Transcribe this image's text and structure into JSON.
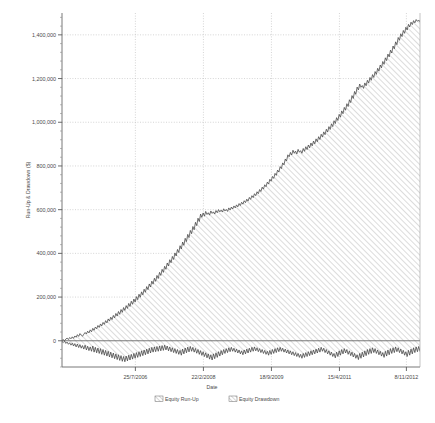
{
  "chart_data": {
    "type": "area",
    "title": "",
    "xlabel": "Date",
    "ylabel": "Run-Up & Drawdown ($)",
    "grid": true,
    "legend_position": "bottom",
    "ylim": [
      -120000,
      1500000
    ],
    "yticks": [
      0,
      200000,
      400000,
      600000,
      800000,
      1000000,
      1200000,
      1400000
    ],
    "ytick_labels": [
      "0",
      "200,000",
      "400,000",
      "600,000",
      "800,000",
      "1,000,000",
      "1,200,000",
      "1,400,000"
    ],
    "xticks": [
      "25/7/2006",
      "22/2/2008",
      "18/9/2009",
      "15/4/2011",
      "8/11/2012"
    ],
    "xtick_positions": [
      0.205,
      0.395,
      0.585,
      0.775,
      0.962
    ],
    "xlim_labels": [
      "start",
      "end"
    ],
    "series": [
      {
        "name": "Equity Run-Up",
        "fill": "hatch",
        "color": "#4d4d4d",
        "values": [
          2000,
          5000,
          1000,
          8000,
          12000,
          6000,
          15000,
          9000,
          18000,
          11000,
          22000,
          16000,
          28000,
          20000,
          33000,
          26000,
          21000,
          30000,
          38000,
          31000,
          44000,
          36000,
          50000,
          41000,
          57000,
          48000,
          63000,
          55000,
          70000,
          61000,
          77000,
          68000,
          84000,
          75000,
          92000,
          82000,
          100000,
          90000,
          108000,
          97000,
          116000,
          105000,
          125000,
          113000,
          134000,
          121000,
          143000,
          130000,
          152000,
          139000,
          161000,
          148000,
          171000,
          157000,
          181000,
          167000,
          191000,
          177000,
          202000,
          188000,
          213000,
          199000,
          224000,
          210000,
          236000,
          222000,
          248000,
          234000,
          260000,
          246000,
          273000,
          259000,
          286000,
          272000,
          299000,
          285000,
          313000,
          299000,
          327000,
          313000,
          341000,
          327000,
          356000,
          342000,
          371000,
          357000,
          386000,
          372000,
          402000,
          388000,
          418000,
          404000,
          435000,
          420000,
          452000,
          437000,
          469000,
          454000,
          487000,
          472000,
          505000,
          490000,
          523000,
          508000,
          542000,
          527000,
          561000,
          546000,
          580000,
          565000,
          585000,
          570000,
          592000,
          578000,
          586000,
          575000,
          594000,
          583000,
          590000,
          580000,
          596000,
          586000,
          600000,
          590000,
          598000,
          589000,
          604000,
          594000,
          601000,
          592000,
          608000,
          598000,
          612000,
          603000,
          617000,
          608000,
          622000,
          613000,
          628000,
          619000,
          634000,
          625000,
          641000,
          632000,
          648000,
          639000,
          656000,
          647000,
          664000,
          655000,
          673000,
          664000,
          682000,
          673000,
          692000,
          683000,
          703000,
          694000,
          714000,
          705000,
          726000,
          717000,
          739000,
          730000,
          752000,
          743000,
          766000,
          757000,
          781000,
          772000,
          797000,
          788000,
          814000,
          805000,
          832000,
          823000,
          851000,
          842000,
          862000,
          850000,
          872000,
          858000,
          868000,
          855000,
          876000,
          863000,
          870000,
          858000,
          880000,
          867000,
          888000,
          875000,
          896000,
          883000,
          905000,
          892000,
          914000,
          901000,
          924000,
          911000,
          934000,
          921000,
          945000,
          932000,
          956000,
          943000,
          968000,
          955000,
          980000,
          967000,
          993000,
          980000,
          1007000,
          994000,
          1021000,
          1008000,
          1036000,
          1023000,
          1052000,
          1039000,
          1068000,
          1055000,
          1085000,
          1072000,
          1103000,
          1090000,
          1122000,
          1109000,
          1141000,
          1128000,
          1161000,
          1148000,
          1175000,
          1160000,
          1168000,
          1155000,
          1180000,
          1167000,
          1192000,
          1179000,
          1205000,
          1192000,
          1218000,
          1205000,
          1232000,
          1219000,
          1247000,
          1234000,
          1262000,
          1249000,
          1278000,
          1265000,
          1295000,
          1282000,
          1312000,
          1299000,
          1330000,
          1317000,
          1349000,
          1336000,
          1368000,
          1355000,
          1388000,
          1375000,
          1405000,
          1392000,
          1420000,
          1407000,
          1435000,
          1422000,
          1448000,
          1436000,
          1458000,
          1447000,
          1465000,
          1455000,
          1470000,
          1462000,
          1468000,
          1460000
        ]
      },
      {
        "name": "Equity Drawdown",
        "fill": "hatch",
        "color": "#4d4d4d",
        "values": [
          -3000,
          -8000,
          -2000,
          -12000,
          -6000,
          -16000,
          -9000,
          -20000,
          -11000,
          -24000,
          -13000,
          -28000,
          -15000,
          -31000,
          -18000,
          -34000,
          -22000,
          -38000,
          -20000,
          -42000,
          -25000,
          -45000,
          -28000,
          -48000,
          -24000,
          -52000,
          -30000,
          -55000,
          -33000,
          -58000,
          -36000,
          -62000,
          -40000,
          -66000,
          -44000,
          -70000,
          -48000,
          -74000,
          -52000,
          -78000,
          -56000,
          -82000,
          -60000,
          -86000,
          -64000,
          -90000,
          -68000,
          -94000,
          -72000,
          -96000,
          -70000,
          -92000,
          -66000,
          -88000,
          -62000,
          -84000,
          -58000,
          -80000,
          -54000,
          -76000,
          -50000,
          -72000,
          -46000,
          -68000,
          -42000,
          -64000,
          -38000,
          -60000,
          -34000,
          -56000,
          -30000,
          -52000,
          -28000,
          -50000,
          -26000,
          -48000,
          -24000,
          -46000,
          -22000,
          -44000,
          -20000,
          -42000,
          -24000,
          -46000,
          -28000,
          -50000,
          -32000,
          -54000,
          -36000,
          -58000,
          -40000,
          -62000,
          -44000,
          -66000,
          -38000,
          -60000,
          -33000,
          -55000,
          -29000,
          -51000,
          -26000,
          -48000,
          -30000,
          -52000,
          -35000,
          -57000,
          -40000,
          -62000,
          -45000,
          -67000,
          -50000,
          -72000,
          -55000,
          -78000,
          -60000,
          -84000,
          -64000,
          -88000,
          -60000,
          -82000,
          -55000,
          -76000,
          -50000,
          -70000,
          -45000,
          -64000,
          -40000,
          -58000,
          -36000,
          -54000,
          -32000,
          -50000,
          -30000,
          -48000,
          -34000,
          -52000,
          -38000,
          -56000,
          -42000,
          -60000,
          -46000,
          -64000,
          -42000,
          -60000,
          -38000,
          -56000,
          -34000,
          -52000,
          -30000,
          -48000,
          -28000,
          -46000,
          -32000,
          -50000,
          -36000,
          -54000,
          -40000,
          -58000,
          -44000,
          -62000,
          -48000,
          -66000,
          -44000,
          -62000,
          -40000,
          -58000,
          -36000,
          -54000,
          -32000,
          -50000,
          -30000,
          -48000,
          -34000,
          -52000,
          -38000,
          -56000,
          -42000,
          -60000,
          -46000,
          -64000,
          -50000,
          -68000,
          -54000,
          -72000,
          -58000,
          -76000,
          -62000,
          -80000,
          -58000,
          -76000,
          -54000,
          -72000,
          -50000,
          -68000,
          -46000,
          -64000,
          -42000,
          -60000,
          -38000,
          -56000,
          -34000,
          -52000,
          -30000,
          -48000,
          -34000,
          -54000,
          -40000,
          -60000,
          -46000,
          -66000,
          -52000,
          -72000,
          -58000,
          -78000,
          -52000,
          -72000,
          -46000,
          -66000,
          -40000,
          -60000,
          -36000,
          -56000,
          -40000,
          -62000,
          -46000,
          -68000,
          -52000,
          -74000,
          -58000,
          -80000,
          -64000,
          -86000,
          -58000,
          -80000,
          -52000,
          -74000,
          -46000,
          -68000,
          -40000,
          -62000,
          -36000,
          -58000,
          -32000,
          -54000,
          -36000,
          -58000,
          -42000,
          -64000,
          -48000,
          -70000,
          -54000,
          -76000,
          -48000,
          -70000,
          -42000,
          -64000,
          -36000,
          -58000,
          -32000,
          -54000,
          -28000,
          -50000,
          -32000,
          -54000,
          -38000,
          -60000,
          -44000,
          -66000,
          -50000,
          -72000,
          -44000,
          -66000,
          -38000,
          -60000,
          -32000,
          -54000,
          -28000,
          -50000,
          -26000,
          -48000
        ]
      }
    ]
  },
  "legend": {
    "items": [
      {
        "label": "Equity Run-Up"
      },
      {
        "label": "Equity Drawdown"
      }
    ]
  }
}
